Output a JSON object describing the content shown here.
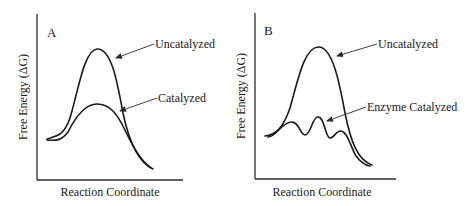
{
  "figure": {
    "panels": [
      {
        "id": "A",
        "panel_label": "A",
        "y_axis_label": "Free Energy (ΔG)",
        "x_axis_label": "Reaction Coordinate",
        "curves": [
          {
            "name": "uncatalyzed",
            "label": "Uncatalyzed",
            "description": "single tall energy barrier"
          },
          {
            "name": "catalyzed",
            "label": "Catalyzed",
            "description": "single lower energy barrier"
          }
        ]
      },
      {
        "id": "B",
        "panel_label": "B",
        "y_axis_label": "Free Energy (ΔG)",
        "x_axis_label": "Reaction Coordinate",
        "curves": [
          {
            "name": "uncatalyzed",
            "label": "Uncatalyzed",
            "description": "single tall energy barrier"
          },
          {
            "name": "enzyme-catalyzed",
            "label": "Enzyme Catalyzed",
            "description": "three small barriers with two intermediates"
          }
        ]
      }
    ]
  },
  "colors": {
    "line": "#1a1a1a",
    "background": "#ffffff"
  }
}
